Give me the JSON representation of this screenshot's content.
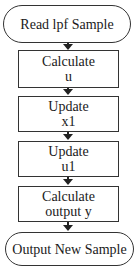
{
  "flowchart": {
    "start": {
      "label": "Read lpf Sample"
    },
    "steps": [
      {
        "line1": "Calculate",
        "line2": "u"
      },
      {
        "line1": "Update",
        "line2": "x1"
      },
      {
        "line1": "Update",
        "line2": "u1"
      },
      {
        "line1": "Calculate",
        "line2": "output y"
      }
    ],
    "end": {
      "label": "Output New Sample"
    }
  }
}
